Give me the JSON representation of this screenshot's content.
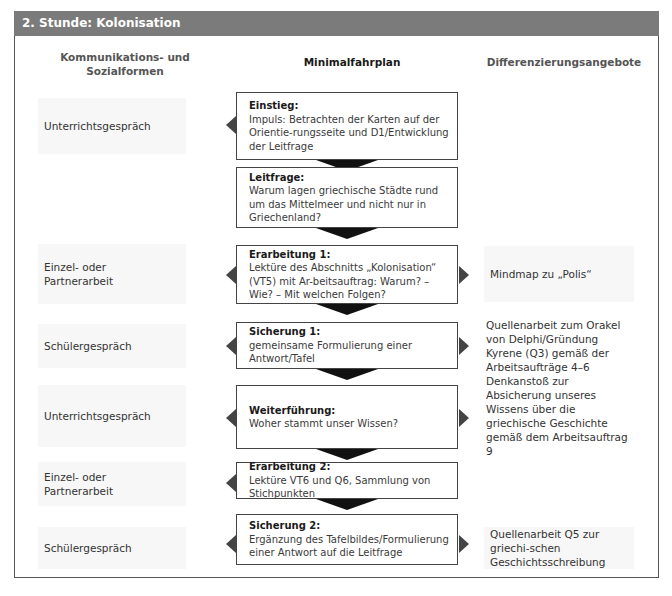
{
  "header": {
    "title": "2. Stunde: Kolonisation"
  },
  "columns": {
    "left": "Kommunikations- und Sozialformen",
    "middle": "Minimalfahrplan",
    "right": "Differenzierungsangebote"
  },
  "left_cells": [
    {
      "label": "Unterrichtsgespräch"
    },
    {
      "label": "Einzel- oder Partnerarbeit"
    },
    {
      "label": "Schülergespräch"
    },
    {
      "label": "Unterrichtsgespräch"
    },
    {
      "label": "Einzel- oder Partnerarbeit"
    },
    {
      "label": "Schülergespräch"
    }
  ],
  "steps": [
    {
      "title": "Einstieg:",
      "text": "Impuls: Betrachten der Karten auf der Orientie-rungsseite und D1/Entwicklung der Leitfrage"
    },
    {
      "title": "Leitfrage:",
      "text": "Warum lagen griechische Städte rund um das Mittelmeer und nicht nur in Griechenland?"
    },
    {
      "title": "Erarbeitung 1:",
      "text": "Lektüre des Abschnitts „Kolonisation“ (VT5) mit Ar-beitsauftrag: Warum? – Wie? – Mit welchen Folgen?"
    },
    {
      "title": "Sicherung 1:",
      "text": "gemeinsame Formulierung einer Antwort/Tafel"
    },
    {
      "title": "Weiterführung:",
      "text": "Woher stammt unser Wissen?"
    },
    {
      "title": "Erarbeitung  2:",
      "text": "Lektüre VT6 und Q6, Sammlung von Stichpunkten"
    },
    {
      "title": "Sicherung 2:",
      "text": "Ergänzung des Tafelbildes/Formulierung einer Antwort auf die Leitfrage"
    }
  ],
  "right_cells": [
    {
      "label": "Mindmap zu „Polis“"
    },
    {
      "label": "Quellenarbeit zum Orakel von Delphi/Gründung Kyrene (Q3) gemäß der Arbeitsaufträge 4–6"
    },
    {
      "label": "Denkanstoß zur Absicherung unseres Wissens über die griechische Geschichte gemäß dem Arbeitsauftrag 9"
    },
    {
      "label": "Quellenarbeit Q5 zur griechi-schen Geschichtsschreibung"
    }
  ],
  "colors": {
    "header_bg": "#7b7b7b",
    "arrow": "#111111",
    "side_arrow": "#444444"
  }
}
